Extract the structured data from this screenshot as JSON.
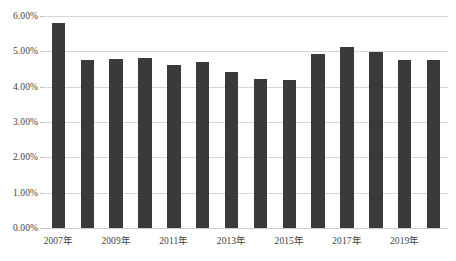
{
  "chart_data": {
    "type": "bar",
    "title": "",
    "subtitle": "",
    "xlabel": "",
    "ylabel": "",
    "categories": [
      "2007年",
      "2008年",
      "2009年",
      "2010年",
      "2011年",
      "2012年",
      "2013年",
      "2014年",
      "2015年",
      "2016年",
      "2017年",
      "2018年",
      "2019年",
      "2020年"
    ],
    "values": [
      5.8,
      4.76,
      4.79,
      4.82,
      4.61,
      4.7,
      4.41,
      4.21,
      4.18,
      4.93,
      5.12,
      4.97,
      4.76,
      4.76
    ],
    "value_unit": "%",
    "ylim": [
      0.0,
      6.0
    ],
    "ytick_values": [
      0.0,
      1.0,
      2.0,
      3.0,
      4.0,
      5.0,
      6.0
    ],
    "ytick_labels": [
      "0.00%",
      "1.00%",
      "2.00%",
      "3.00%",
      "4.00%",
      "5.00%",
      "6.00%"
    ],
    "xtick_labels": [
      "2007年",
      "2009年",
      "2011年",
      "2013年",
      "2015年",
      "2017年",
      "2019年"
    ],
    "xtick_category_indexes": [
      0,
      2,
      4,
      6,
      8,
      10,
      12
    ],
    "grid": true,
    "grid_axis": "y",
    "legend": false,
    "legend_position": "none",
    "series": [
      {
        "name": "",
        "values": [
          5.8,
          4.76,
          4.79,
          4.82,
          4.61,
          4.7,
          4.41,
          4.21,
          4.18,
          4.93,
          5.12,
          4.97,
          4.76,
          4.76
        ]
      }
    ],
    "colors": {
      "bar": "#3a3a3a",
      "gridline": "#d6d6d6",
      "baseline": "#c9c9c9",
      "text": "#3f3f3f",
      "background": "#ffffff"
    }
  }
}
